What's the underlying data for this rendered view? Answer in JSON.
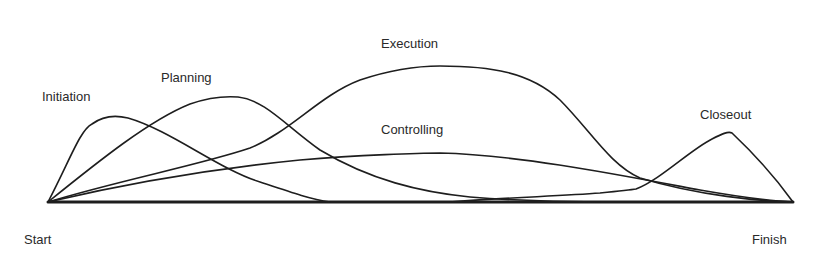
{
  "diagram": {
    "type": "overlapping-process-curves",
    "labels": {
      "initiation": "Initiation",
      "planning": "Planning",
      "execution": "Execution",
      "controlling": "Controlling",
      "closeout": "Closeout",
      "start": "Start",
      "finish": "Finish"
    },
    "colors": {
      "line": "#1e1e1e",
      "text": "#2a2a2a",
      "background": "#ffffff"
    }
  }
}
